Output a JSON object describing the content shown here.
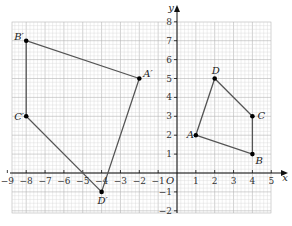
{
  "figure": {
    "axes": {
      "x_label": "x",
      "y_label": "y",
      "origin_label": "O",
      "x_range": [
        -9,
        5
      ],
      "y_range": [
        -2,
        8
      ],
      "x_ticks": [
        "-9",
        "-8",
        "-7",
        "-6",
        "-5",
        "-4",
        "-3",
        "-2",
        "-1",
        "1",
        "2",
        "3",
        "4",
        "5"
      ],
      "y_ticks": [
        "-2",
        "-1",
        "1",
        "2",
        "3",
        "4",
        "5",
        "6",
        "7",
        "8"
      ],
      "grid": "fine graph paper, 5 minor lines per unit"
    },
    "shapes": [
      {
        "name": "ABCD",
        "points": [
          {
            "label": "A",
            "x": 1,
            "y": 2
          },
          {
            "label": "B",
            "x": 4,
            "y": 1
          },
          {
            "label": "C",
            "x": 4,
            "y": 3
          },
          {
            "label": "D",
            "x": 2,
            "y": 5
          }
        ]
      },
      {
        "name": "A'B'C'D'",
        "points": [
          {
            "label": "A′",
            "x": -2,
            "y": 5
          },
          {
            "label": "B′",
            "x": -8,
            "y": 7
          },
          {
            "label": "C′",
            "x": -8,
            "y": 3
          },
          {
            "label": "D′",
            "x": -4,
            "y": -1
          }
        ]
      }
    ],
    "colors": {
      "grid_minor": "#d6d6d6",
      "grid_major": "#b5b5b5",
      "axis": "#111111",
      "shape_line": "#555555",
      "point": "#000000"
    }
  }
}
